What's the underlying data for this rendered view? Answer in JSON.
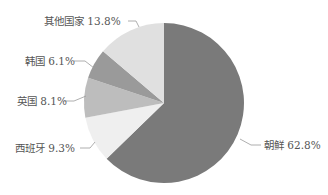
{
  "chart_data": {
    "type": "pie",
    "title": "",
    "start_angle": "12 o'clock",
    "direction": "clockwise",
    "legend": "none (direct labels with leader lines)",
    "slices": [
      {
        "label": "朝鲜",
        "value": 62.8,
        "display": "朝鲜 62.8%",
        "color": "#7a7a7a"
      },
      {
        "label": "西班牙",
        "value": 9.3,
        "display": "西班牙 9.3%",
        "color": "#efefef"
      },
      {
        "label": "英国",
        "value": 8.1,
        "display": "英国 8.1%",
        "color": "#bdbdbd"
      },
      {
        "label": "韩国",
        "value": 6.1,
        "display": "韩国 6.1%",
        "color": "#9a9a9a"
      },
      {
        "label": "其他国家",
        "value": 13.8,
        "display": "其他国家 13.8%",
        "color": "#e0e0e0"
      }
    ]
  },
  "labels": {
    "north_korea": "朝鲜 62.8%",
    "spain": "西班牙 9.3%",
    "uk": "英国 8.1%",
    "korea": "韩国 6.1%",
    "others": "其他国家 13.8%"
  }
}
